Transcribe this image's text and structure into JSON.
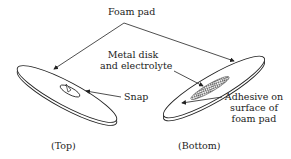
{
  "diagram": {
    "labels": {
      "foam_pad": "Foam pad",
      "metal_disk_line1": "Metal disk",
      "metal_disk_line2": "and electrolyte",
      "snap": "Snap",
      "adhesive_line1": "Adhesive on",
      "adhesive_line2": "surface of",
      "adhesive_line3": "foam pad",
      "top_caption": "(Top)",
      "bottom_caption": "(Bottom)"
    },
    "colors": {
      "stroke": "#222222",
      "background": "#ffffff",
      "hatch": "#555555"
    }
  }
}
